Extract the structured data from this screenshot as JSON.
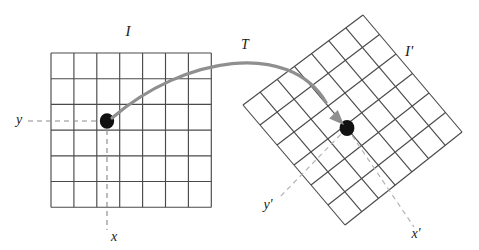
{
  "figure": {
    "title": "",
    "background_color": "#ffffff",
    "grid_line_color": "#4a4a4a",
    "dashed_line_color": "#8c8c8c",
    "arrow_color": "#8f8f8f",
    "dot_color": "#111111",
    "label_color": "#1a1a1a"
  },
  "source_image": {
    "label": "I",
    "label_x": 128,
    "label_y": 36,
    "columns": 7,
    "rows": 6,
    "origin_x": 51,
    "origin_y": 53,
    "cell_width": 22.9,
    "cell_height": 25.7,
    "point": {
      "label_x": "x",
      "label_y": "y",
      "x_label_pos_x": 114,
      "x_label_pos_y": 241,
      "y_label_pos_x": 19,
      "y_label_pos_y": 124,
      "dot_cx": 107,
      "dot_cy": 121,
      "dot_rx": 7.2,
      "dot_ry": 7.8
    }
  },
  "target_image": {
    "label": "I'",
    "label_x": 409,
    "label_y": 56,
    "columns": 7,
    "rows": 6,
    "rotation_deg": -38,
    "corner_top_x": 363,
    "corner_top_y": 15,
    "corner_left_x": 243,
    "corner_left_y": 105,
    "corner_right_x": 462,
    "corner_right_y": 132,
    "corner_bottom_x": 345,
    "corner_bottom_y": 225,
    "point": {
      "label_x": "x'",
      "label_y": "y'",
      "x_label_pos_x": 416,
      "x_label_pos_y": 238,
      "y_label_pos_x": 268,
      "y_label_pos_y": 209,
      "dot_cx": 347,
      "dot_cy": 128,
      "dot_rx": 7.4,
      "dot_ry": 8.0
    }
  },
  "transform": {
    "label": "T",
    "label_x": 245,
    "label_y": 49,
    "arrow_start_x": 112,
    "arrow_start_y": 118,
    "arrow_end_x": 344,
    "arrow_end_y": 125,
    "stroke_width": 3.2
  }
}
